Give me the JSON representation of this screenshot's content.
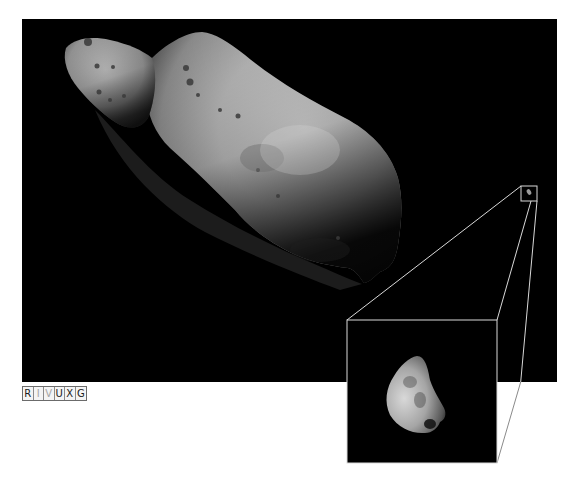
{
  "figure": {
    "main_panel": {
      "background": "#000000",
      "bounds": {
        "x": 22,
        "y": 19,
        "width": 535,
        "height": 363
      }
    },
    "zoom_box": {
      "bounds": {
        "x": 521,
        "y": 186,
        "width": 16,
        "height": 15
      },
      "stroke": "#d9d9d9"
    },
    "inset_panel": {
      "bounds": {
        "x": 347,
        "y": 320,
        "width": 150,
        "height": 143
      },
      "stroke": "#d9d9d9",
      "background": "#000000"
    },
    "connector_lines": [
      {
        "from": [
          521,
          186
        ],
        "to": [
          347,
          320
        ]
      },
      {
        "from": [
          531,
          201
        ],
        "to": [
          497,
          320
        ]
      },
      {
        "from": [
          537,
          201
        ],
        "to": [
          497,
          463
        ]
      }
    ],
    "wavelength_strip": {
      "cells": [
        {
          "letter": "R",
          "active": true
        },
        {
          "letter": "I",
          "active": false
        },
        {
          "letter": "V",
          "active": false
        },
        {
          "letter": "U",
          "active": true
        },
        {
          "letter": "X",
          "active": true
        },
        {
          "letter": "G",
          "active": true
        }
      ]
    }
  }
}
